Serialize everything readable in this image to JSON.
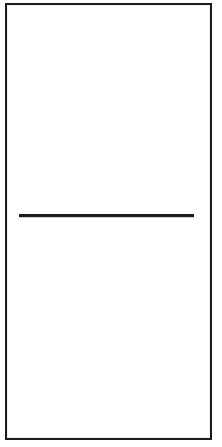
{
  "document": {
    "type": "scanned-figure",
    "page_width": 222,
    "page_height": 447,
    "background_color": "#ffffff",
    "ink_color": "#1b1b1b",
    "title": "",
    "caption": "",
    "visible_text": ""
  },
  "frame": {
    "name": "outer-rectangle",
    "label": "",
    "stroke_color": "#1b1b1b",
    "stroke_width_px": 2,
    "x": 5,
    "y": 3,
    "width": 207,
    "height": 437
  },
  "marks": [
    {
      "name": "horizontal-rule",
      "shape": "line",
      "label": "",
      "stroke_color": "#1c1c1c",
      "stroke_width_px": 3,
      "x_start": 19,
      "x_end": 194,
      "y": 215,
      "length_px": 175
    }
  ],
  "regions": {
    "upper": {
      "label": "",
      "content": ""
    },
    "lower": {
      "label": "",
      "content": ""
    }
  }
}
